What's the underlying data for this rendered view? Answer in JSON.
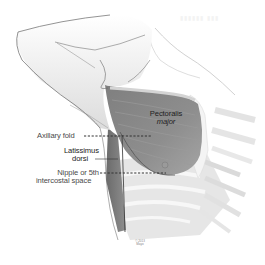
{
  "figure": {
    "labels": {
      "pectoralis": [
        "Pectoralis",
        "major"
      ],
      "axillary_fold": "Axillary fold",
      "latissimus": [
        "Latissimus",
        "dorsi"
      ],
      "nipple": [
        "Nipple or 5th",
        "intercostal space"
      ]
    },
    "credit": [
      "© 2013",
      "Mayo"
    ],
    "colors": {
      "muscle": "#8a8a8a",
      "muscle_dark": "#6e6e6e",
      "outline": "#555555",
      "rib": "#d8d8d8",
      "background": "#ffffff"
    }
  }
}
